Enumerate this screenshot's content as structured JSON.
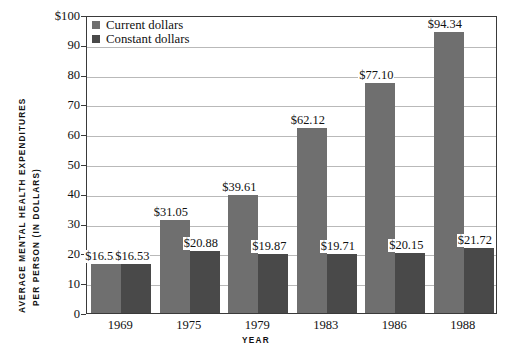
{
  "chart_data": {
    "type": "bar",
    "title": "",
    "xlabel": "YEAR",
    "ylabel": "AVERAGE MENTAL HEALTH EXPENDITURES PER PERSON (IN DOLLARS)",
    "ylabel_line1": "AVERAGE MENTAL HEALTH EXPENDITURES",
    "ylabel_line2": "PER PERSON (IN DOLLARS)",
    "categories": [
      "1969",
      "1975",
      "1979",
      "1983",
      "1986",
      "1988"
    ],
    "series": [
      {
        "name": "Current dollars",
        "color": "#6f6f6f",
        "values": [
          16.53,
          31.05,
          39.61,
          62.12,
          77.1,
          94.34
        ],
        "labels": [
          "$16.53",
          "$31.05",
          "$39.61",
          "$62.12",
          "$77.10",
          "$94.34"
        ]
      },
      {
        "name": "Constant dollars",
        "color": "#494949",
        "values": [
          16.53,
          20.88,
          19.87,
          19.71,
          20.15,
          21.72
        ],
        "labels": [
          "$16.53",
          "$20.88",
          "$19.87",
          "$19.71",
          "$20.15",
          "$21.72"
        ]
      }
    ],
    "ylim": [
      0,
      100
    ],
    "yticks": [
      0,
      10,
      20,
      30,
      40,
      50,
      60,
      70,
      80,
      90,
      100
    ],
    "ytick_labels": [
      "0",
      "10",
      "20",
      "30",
      "40",
      "50",
      "60",
      "70",
      "80",
      "90",
      "$100"
    ],
    "grid": true,
    "legend_position": "top-left",
    "legend": [
      "Current dollars",
      "Constant dollars"
    ]
  }
}
